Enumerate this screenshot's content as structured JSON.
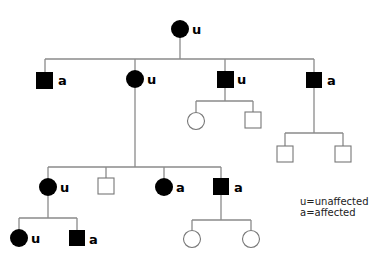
{
  "diagram": {
    "type": "pedigree",
    "colors": {
      "affected_fill": "#000000",
      "line": "#8a8a8a",
      "unaffected_outline": "#777777"
    },
    "legend": {
      "u": "u=unaffected",
      "a": "a=affected"
    },
    "individuals": [
      {
        "id": "I-1",
        "sex": "female",
        "filled": true,
        "label": "u",
        "gen": 1
      },
      {
        "id": "II-1",
        "sex": "male",
        "filled": true,
        "label": "a",
        "gen": 2
      },
      {
        "id": "II-2",
        "sex": "female",
        "filled": true,
        "label": "u",
        "gen": 2
      },
      {
        "id": "II-3",
        "sex": "male",
        "filled": true,
        "label": "u",
        "gen": 2
      },
      {
        "id": "II-4",
        "sex": "male",
        "filled": true,
        "label": "a",
        "gen": 2
      },
      {
        "id": "III-1",
        "sex": "female",
        "filled": false,
        "label": "",
        "gen": 3,
        "parent": "II-3"
      },
      {
        "id": "III-2",
        "sex": "male",
        "filled": false,
        "label": "",
        "gen": 3,
        "parent": "II-3"
      },
      {
        "id": "III-3",
        "sex": "male",
        "filled": false,
        "label": "",
        "gen": 3,
        "parent": "II-4"
      },
      {
        "id": "III-4",
        "sex": "male",
        "filled": false,
        "label": "",
        "gen": 3,
        "parent": "II-4"
      },
      {
        "id": "III-5",
        "sex": "female",
        "filled": true,
        "label": "u",
        "gen": 3,
        "parent": "II-2"
      },
      {
        "id": "III-6",
        "sex": "male",
        "filled": false,
        "label": "",
        "gen": 3,
        "parent": "II-2"
      },
      {
        "id": "III-7",
        "sex": "female",
        "filled": true,
        "label": "a",
        "gen": 3,
        "parent": "II-2"
      },
      {
        "id": "III-8",
        "sex": "male",
        "filled": true,
        "label": "a",
        "gen": 3,
        "parent": "II-2"
      },
      {
        "id": "IV-1",
        "sex": "female",
        "filled": true,
        "label": "u",
        "gen": 4,
        "parent": "III-5"
      },
      {
        "id": "IV-2",
        "sex": "male",
        "filled": true,
        "label": "a",
        "gen": 4,
        "parent": "III-5"
      },
      {
        "id": "IV-3",
        "sex": "female",
        "filled": false,
        "label": "",
        "gen": 4,
        "parent": "III-8"
      },
      {
        "id": "IV-4",
        "sex": "female",
        "filled": false,
        "label": "",
        "gen": 4,
        "parent": "III-8"
      }
    ]
  }
}
